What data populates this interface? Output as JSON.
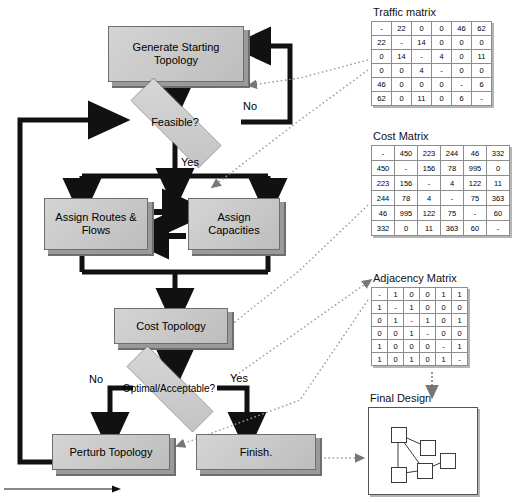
{
  "diagram": {
    "type": "flowchart",
    "nodes": {
      "generate": "Generate Starting Topology",
      "feasible": "Feasible?",
      "assign_routes": "Assign Routes & Flows",
      "assign_capacities": "Assign Capacities",
      "cost_topology": "Cost Topology",
      "optimal": "Optimal/Acceptable?",
      "perturb": "Perturb Topology",
      "finish": "Finish."
    },
    "edge_labels": {
      "feasible_no": "No",
      "feasible_yes": "Yes",
      "optimal_no": "No",
      "optimal_yes": "Yes"
    }
  },
  "panels": {
    "traffic": {
      "title": "Traffic matrix",
      "rows": [
        [
          "-",
          "22",
          "0",
          "0",
          "46",
          "62"
        ],
        [
          "22",
          "-",
          "14",
          "0",
          "0",
          "0"
        ],
        [
          "0",
          "14",
          "-",
          "4",
          "0",
          "11"
        ],
        [
          "0",
          "0",
          "4",
          "-",
          "0",
          "0"
        ],
        [
          "46",
          "0",
          "0",
          "0",
          "-",
          "6"
        ],
        [
          "62",
          "0",
          "11",
          "0",
          "6",
          "-"
        ]
      ]
    },
    "cost": {
      "title": "Cost Matrix",
      "rows": [
        [
          "-",
          "450",
          "223",
          "244",
          "46",
          "332"
        ],
        [
          "450",
          "-",
          "156",
          "78",
          "995",
          "0"
        ],
        [
          "223",
          "156",
          "-",
          "4",
          "122",
          "11"
        ],
        [
          "244",
          "78",
          "4",
          "-",
          "75",
          "363"
        ],
        [
          "46",
          "995",
          "122",
          "75",
          "-",
          "60"
        ],
        [
          "332",
          "0",
          "11",
          "363",
          "60",
          "-"
        ]
      ]
    },
    "adjacency": {
      "title": "Adjacency Matrix",
      "rows": [
        [
          "-",
          "1",
          "0",
          "0",
          "1",
          "1"
        ],
        [
          "1",
          "-",
          "1",
          "0",
          "0",
          "0"
        ],
        [
          "0",
          "1",
          "-",
          "1",
          "0",
          "1"
        ],
        [
          "0",
          "0",
          "1",
          "-",
          "0",
          "0"
        ],
        [
          "1",
          "0",
          "0",
          "0",
          "-",
          "1"
        ],
        [
          "1",
          "0",
          "1",
          "0",
          "1",
          "-"
        ]
      ]
    },
    "final_design": {
      "title": "Final Design",
      "node_count": "5"
    }
  },
  "colors": {
    "box_fill": "#c8c8c8",
    "box_border": "#6e6e6e",
    "line": "#000000",
    "dotted": "#8a8a8a",
    "panel_bg": "#ffffff"
  }
}
